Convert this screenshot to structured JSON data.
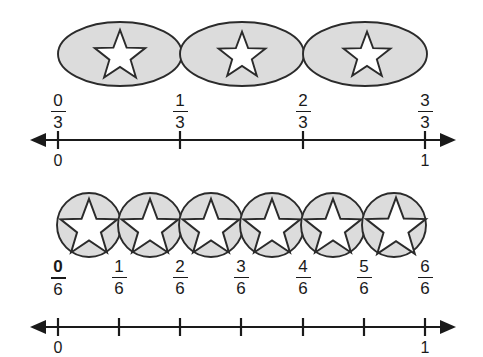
{
  "figure": {
    "type": "fraction-number-lines",
    "background": "#ffffff",
    "ink": "#1a1a1a",
    "shape_fill": "#dcdcdc",
    "star_fill": "#ffffff"
  },
  "rows": [
    {
      "id": "thirds",
      "denominator": 3,
      "shape": "ellipse",
      "shape_count": 3,
      "shapes": [
        {
          "index": 1,
          "icon": "star-icon"
        },
        {
          "index": 2,
          "icon": "star-icon"
        },
        {
          "index": 3,
          "icon": "star-icon"
        }
      ],
      "fraction_labels": [
        {
          "num": "0",
          "den": "3",
          "bold": false,
          "value": 0
        },
        {
          "num": "1",
          "den": "3",
          "bold": false,
          "value": 0.3333
        },
        {
          "num": "2",
          "den": "3",
          "bold": false,
          "value": 0.6667
        },
        {
          "num": "3",
          "den": "3",
          "bold": false,
          "value": 1
        }
      ],
      "endpoint_labels": [
        {
          "text": "0",
          "value": 0
        },
        {
          "text": "1",
          "value": 1
        }
      ],
      "tick_count": 4,
      "line": {
        "left_arrow": true,
        "right_arrow": true
      }
    },
    {
      "id": "sixths",
      "denominator": 6,
      "shape": "circle",
      "shape_count": 6,
      "shapes": [
        {
          "index": 1,
          "icon": "star-icon"
        },
        {
          "index": 2,
          "icon": "star-icon"
        },
        {
          "index": 3,
          "icon": "star-icon"
        },
        {
          "index": 4,
          "icon": "star-icon"
        },
        {
          "index": 5,
          "icon": "star-icon"
        },
        {
          "index": 6,
          "icon": "star-icon"
        }
      ],
      "fraction_labels": [
        {
          "num": "0",
          "den": "6",
          "bold": true,
          "value": 0
        },
        {
          "num": "1",
          "den": "6",
          "bold": false,
          "value": 0.1667
        },
        {
          "num": "2",
          "den": "6",
          "bold": false,
          "value": 0.3333
        },
        {
          "num": "3",
          "den": "6",
          "bold": false,
          "value": 0.5
        },
        {
          "num": "4",
          "den": "6",
          "bold": false,
          "value": 0.6667
        },
        {
          "num": "5",
          "den": "6",
          "bold": false,
          "value": 0.8333
        },
        {
          "num": "6",
          "den": "6",
          "bold": false,
          "value": 1
        }
      ],
      "endpoint_labels": [
        {
          "text": "0",
          "value": 0
        },
        {
          "text": "1",
          "value": 1
        }
      ],
      "tick_count": 7,
      "line": {
        "left_arrow": true,
        "right_arrow": true
      }
    }
  ]
}
